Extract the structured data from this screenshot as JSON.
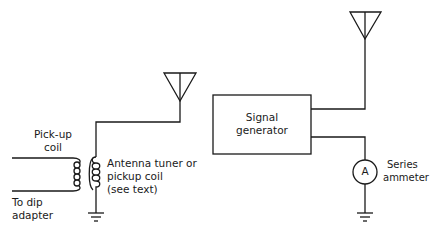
{
  "diagram": {
    "type": "circuit-schematic",
    "left_circuit": {
      "pickup_coil_label_line1": "Pick-up",
      "pickup_coil_label_line2": "coil",
      "dip_adapter_label_line1": "To dip",
      "dip_adapter_label_line2": "adapter",
      "tuner_label_line1": "Antenna tuner or",
      "tuner_label_line2": "pickup coil",
      "tuner_label_line3": "(see text)"
    },
    "right_circuit": {
      "generator_label_line1": "Signal",
      "generator_label_line2": "generator",
      "ammeter_symbol": "A",
      "ammeter_label_line1": "Series",
      "ammeter_label_line2": "ammeter"
    },
    "colors": {
      "line": "#1a1a1a",
      "background": "#ffffff"
    }
  }
}
